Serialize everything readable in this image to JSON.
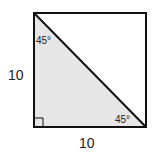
{
  "diagram": {
    "shape": "square with diagonal forming right isosceles triangle",
    "labels": {
      "left_side": "10",
      "bottom_side": "10",
      "top_angle": "45°",
      "bottom_right_angle": "45°"
    },
    "colors": {
      "stroke": "#111111",
      "triangle_fill": "#e6e6e6",
      "background": "#ffffff"
    }
  }
}
